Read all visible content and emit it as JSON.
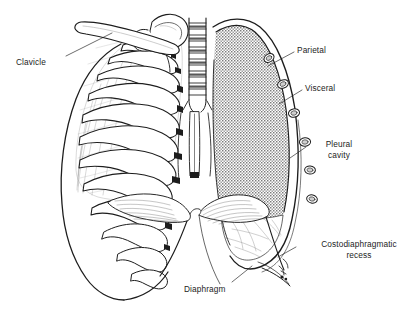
{
  "figure": {
    "name": "thorax-pleura-cross-section",
    "background_color": "#ffffff",
    "ink_color": "#1d1d1d",
    "stipple_color": "#8d8d8d"
  },
  "labels": [
    {
      "id": "clavicle",
      "text": "Clavicle",
      "x": 16,
      "y": 57,
      "align": "left",
      "leader": {
        "x1": 66,
        "y1": 56,
        "x2": 112,
        "y2": 33
      }
    },
    {
      "id": "parietal",
      "text": "Parietal",
      "x": 297,
      "y": 45,
      "align": "left",
      "leader": {
        "x1": 294,
        "y1": 52,
        "x2": 268,
        "y2": 66
      }
    },
    {
      "id": "visceral",
      "text": "Visceral",
      "x": 305,
      "y": 83,
      "align": "left",
      "leader": {
        "x1": 302,
        "y1": 90,
        "x2": 279,
        "y2": 104
      }
    },
    {
      "id": "pleural-cavity",
      "line1": "Pleural",
      "line2": "cavity",
      "x": 323,
      "y": 139,
      "align": "center",
      "leader": {
        "x1": 318,
        "y1": 147,
        "x2": 297,
        "y2": 160
      }
    },
    {
      "id": "costodiaphragmatic-recess",
      "line1": "Costodiaphragmatic",
      "line2": "recess",
      "x": 313,
      "y": 239,
      "align": "center",
      "leader": {
        "x1": 310,
        "y1": 247,
        "x2": 286,
        "y2": 259
      }
    },
    {
      "id": "diaphragm",
      "text": "Diaphragm",
      "x": 184,
      "y": 284,
      "align": "left",
      "leader": {
        "x1": 230,
        "y1": 283,
        "x2": 250,
        "y2": 268
      }
    }
  ],
  "structures": [
    {
      "id": "clavicle-bone",
      "name": "clavicle"
    },
    {
      "id": "scapula-bone",
      "name": "scapula"
    },
    {
      "id": "trachea",
      "name": "trachea"
    },
    {
      "id": "rib-cage-left",
      "name": "cut-ribs-left"
    },
    {
      "id": "lung-left-surface",
      "name": "lung-left"
    },
    {
      "id": "pleural-cavity-region",
      "name": "pleural-cavity-stipple"
    },
    {
      "id": "parietal-pleura-line",
      "name": "parietal-pleura"
    },
    {
      "id": "visceral-pleura-line",
      "name": "visceral-pleura"
    },
    {
      "id": "diaphragm-dome",
      "name": "diaphragm"
    },
    {
      "id": "mediastinum",
      "name": "mediastinum"
    },
    {
      "id": "rib-sections",
      "name": "rib-cross-sections",
      "count": 6
    },
    {
      "id": "recess-marker",
      "name": "costodiaphragmatic-recess-marker"
    }
  ]
}
